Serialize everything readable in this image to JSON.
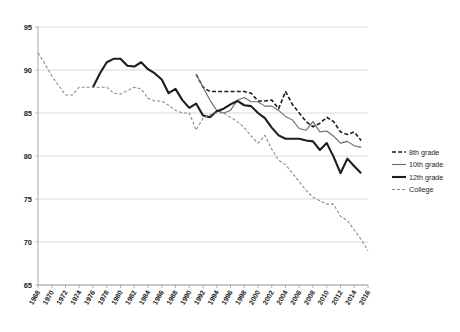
{
  "chart_data": {
    "type": "line",
    "title": "",
    "subtitle": "",
    "xlabel": "",
    "ylabel": "",
    "xlim": [
      1968,
      2016
    ],
    "ylim": [
      65,
      95
    ],
    "grid": true,
    "grid_axis": "y",
    "legend_position": "right",
    "yticks": [
      65,
      70,
      75,
      80,
      85,
      90,
      95
    ],
    "xticks": [
      1968,
      1970,
      1972,
      1974,
      1976,
      1978,
      1980,
      1982,
      1984,
      1986,
      1988,
      1990,
      1992,
      1994,
      1996,
      1998,
      2000,
      2002,
      2004,
      2006,
      2008,
      2010,
      2012,
      2014,
      2016
    ],
    "series": [
      {
        "name": "8th grade",
        "style": "dashed",
        "color": "#1d1d1d",
        "width": 1.6,
        "dash": "4,2.2",
        "x": [
          1991,
          1992,
          1993,
          1994,
          1995,
          1996,
          1997,
          1998,
          1999,
          2000,
          2001,
          2002,
          2003,
          2004,
          2005,
          2006,
          2007,
          2008,
          2009,
          2010,
          2011,
          2012,
          2013,
          2014,
          2015
        ],
        "values": [
          89.5,
          88.0,
          87.5,
          87.5,
          87.5,
          87.5,
          87.5,
          87.5,
          87.3,
          86.4,
          86.4,
          86.5,
          85.5,
          87.5,
          86.0,
          85.0,
          84.0,
          83.4,
          83.8,
          84.5,
          84.0,
          82.8,
          82.5,
          82.8,
          81.8
        ]
      },
      {
        "name": "10th grade",
        "style": "solid-thin",
        "color": "#6b6b6b",
        "width": 1.1,
        "dash": "none",
        "x": [
          1991,
          1992,
          1993,
          1994,
          1995,
          1996,
          1997,
          1998,
          1999,
          2000,
          2001,
          2002,
          2003,
          2004,
          2005,
          2006,
          2007,
          2008,
          2009,
          2010,
          2011,
          2012,
          2013,
          2014,
          2015
        ],
        "values": [
          89.5,
          88.0,
          86.5,
          85.3,
          85.0,
          85.3,
          86.5,
          86.8,
          86.3,
          86.3,
          85.8,
          85.8,
          85.3,
          84.6,
          84.2,
          83.2,
          83.0,
          84.0,
          82.8,
          82.9,
          82.3,
          81.5,
          81.7,
          81.2,
          81.0
        ]
      },
      {
        "name": "12th grade",
        "style": "solid-thick",
        "color": "#1d1d1d",
        "width": 2.1,
        "dash": "none",
        "x": [
          1976,
          1977,
          1978,
          1979,
          1980,
          1981,
          1982,
          1983,
          1984,
          1985,
          1986,
          1987,
          1988,
          1989,
          1990,
          1991,
          1992,
          1993,
          1994,
          1995,
          1996,
          1997,
          1998,
          1999,
          2000,
          2001,
          2002,
          2003,
          2004,
          2005,
          2006,
          2007,
          2008,
          2009,
          2010,
          2011,
          2012,
          2013,
          2014,
          2015
        ],
        "values": [
          88.0,
          89.6,
          90.9,
          91.3,
          91.3,
          90.5,
          90.4,
          90.9,
          90.1,
          89.6,
          88.9,
          87.3,
          87.8,
          86.5,
          85.6,
          86.1,
          84.7,
          84.5,
          85.2,
          85.5,
          86.0,
          86.4,
          85.9,
          85.8,
          85.0,
          84.4,
          83.3,
          82.4,
          82.0,
          82.0,
          82.0,
          81.8,
          81.7,
          80.7,
          81.5,
          79.9,
          78.0,
          79.7,
          78.8,
          78.0
        ]
      },
      {
        "name": "College",
        "style": "dashed-fine",
        "color": "#8a8a8a",
        "width": 1.1,
        "dash": "3,2",
        "x": [
          1968,
          1969,
          1970,
          1971,
          1972,
          1973,
          1974,
          1975,
          1976,
          1977,
          1978,
          1979,
          1980,
          1981,
          1982,
          1983,
          1984,
          1985,
          1986,
          1987,
          1988,
          1989,
          1990,
          1991,
          1992,
          1993,
          1994,
          1995,
          1996,
          1997,
          1998,
          1999,
          2000,
          2001,
          2002,
          2003,
          2004,
          2005,
          2006,
          2007,
          2008,
          2009,
          2010,
          2011,
          2012,
          2013,
          2014,
          2015,
          2016
        ],
        "values": [
          92.0,
          90.7,
          89.3,
          88.2,
          87.1,
          87.1,
          88.0,
          88.0,
          88.0,
          88.0,
          88.0,
          87.3,
          87.2,
          87.6,
          88.0,
          87.8,
          86.7,
          86.4,
          86.4,
          85.9,
          85.3,
          85.0,
          85.0,
          83.0,
          84.4,
          84.8,
          85.0,
          85.0,
          84.5,
          84.0,
          83.3,
          82.3,
          81.5,
          82.4,
          80.8,
          79.5,
          79.0,
          78.0,
          77.0,
          76.0,
          75.2,
          74.8,
          74.4,
          74.4,
          73.0,
          72.5,
          71.4,
          70.3,
          69.0
        ]
      }
    ]
  },
  "legend": {
    "items": [
      {
        "label": "8th grade"
      },
      {
        "label": "10th grade"
      },
      {
        "label": "12th grade"
      },
      {
        "label": "College"
      }
    ]
  }
}
